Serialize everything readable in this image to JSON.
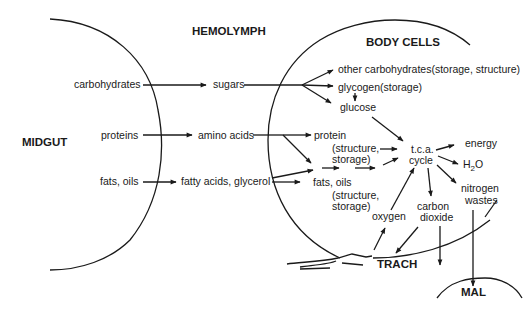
{
  "regions": {
    "midgut": "MIDGUT",
    "hemolymph": "HEMOLYMPH",
    "body_cells": "BODY CELLS",
    "trach": "TRACH",
    "mal": "MAL"
  },
  "midgut_items": {
    "carbohydrates": "carbohydrates",
    "proteins": "proteins",
    "fats": "fats, oils"
  },
  "hemolymph_items": {
    "sugars": "sugars",
    "amino_acids": "amino acids",
    "fatty_acids": "fatty acids, glycerol"
  },
  "cell_items": {
    "other_carbs": "other carbohydrates(storage, structure)",
    "glycogen": "glycogen(storage)",
    "glucose": "glucose",
    "protein": "protein",
    "protein_sub1": "(structure,",
    "protein_sub2": "storage)",
    "fats": "fats, oils",
    "fats_sub1": "(structure,",
    "fats_sub2": "storage)",
    "tca1": "t.c.a.",
    "tca2": "cycle",
    "energy": "energy",
    "water_h": "H",
    "water_2": "2",
    "water_o": "O",
    "nitrogen1": "nitrogen",
    "nitrogen2": "wastes",
    "oxygen": "oxygen",
    "co2_1": "carbon",
    "co2_2": "dioxide"
  },
  "colors": {
    "ink": "#1a1a1a",
    "background": "#ffffff"
  }
}
